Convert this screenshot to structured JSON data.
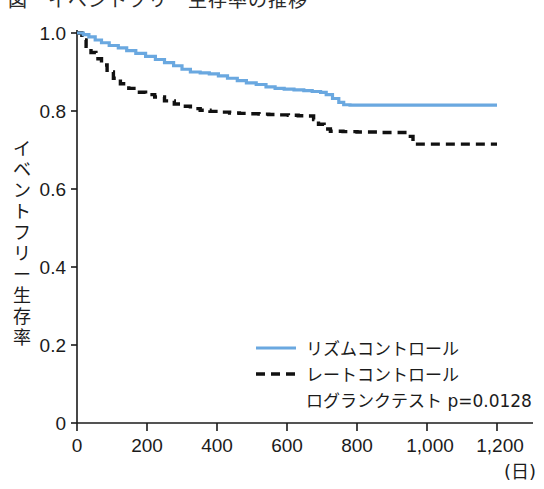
{
  "figure": {
    "top_cut_caption": "図　イベントフリー生存率の推移",
    "background": "#ffffff"
  },
  "chart_data": {
    "type": "line",
    "title": "",
    "subtitle": "",
    "xlabel": "(日)",
    "ylabel": "イベントフリー生存率",
    "xlim": [
      0,
      1290
    ],
    "ylim": [
      0,
      1.0
    ],
    "grid": false,
    "legend_position": "bottom-right",
    "x_ticks": [
      0,
      200,
      400,
      600,
      800,
      1000,
      1200
    ],
    "x_tick_labels": [
      "0",
      "200",
      "400",
      "600",
      "800",
      "1,000",
      "1,200"
    ],
    "y_ticks": [
      0,
      0.2,
      0.4,
      0.6,
      0.8,
      1.0
    ],
    "y_tick_labels": [
      "0",
      "0.2",
      "0.4",
      "0.6",
      "0.8",
      "1.0"
    ],
    "annotations": [
      {
        "name": "logrank-test",
        "text": "ログランクテスト p=0.0128",
        "p_value": "0.0128"
      }
    ],
    "series": [
      {
        "name": "リズムコントロール",
        "style": "solid",
        "color": "#6aa8e0",
        "step": "post",
        "x": [
          0,
          18,
          34,
          52,
          70,
          92,
          118,
          142,
          168,
          196,
          224,
          250,
          276,
          300,
          324,
          352,
          378,
          404,
          430,
          458,
          484,
          512,
          540,
          566,
          592,
          620,
          648,
          672,
          696,
          712,
          730,
          748,
          762,
          780,
          1200
        ],
        "y": [
          1.0,
          0.996,
          0.99,
          0.982,
          0.975,
          0.968,
          0.962,
          0.955,
          0.948,
          0.94,
          0.932,
          0.924,
          0.916,
          0.907,
          0.9,
          0.898,
          0.895,
          0.89,
          0.884,
          0.878,
          0.872,
          0.868,
          0.862,
          0.858,
          0.856,
          0.854,
          0.852,
          0.85,
          0.848,
          0.842,
          0.832,
          0.822,
          0.816,
          0.815,
          0.815
        ]
      },
      {
        "name": "レートコントロール",
        "style": "dashed",
        "color": "#111111",
        "step": "post",
        "x": [
          0,
          14,
          26,
          40,
          54,
          70,
          86,
          104,
          124,
          148,
          172,
          196,
          222,
          250,
          278,
          300,
          324,
          352,
          380,
          408,
          436,
          464,
          492,
          520,
          548,
          576,
          604,
          632,
          660,
          676,
          690,
          706,
          724,
          760,
          800,
          860,
          920,
          944,
          960,
          1200
        ],
        "y": [
          1.0,
          0.982,
          0.966,
          0.95,
          0.934,
          0.918,
          0.9,
          0.884,
          0.87,
          0.858,
          0.848,
          0.842,
          0.836,
          0.826,
          0.818,
          0.812,
          0.806,
          0.802,
          0.799,
          0.797,
          0.795,
          0.794,
          0.793,
          0.792,
          0.791,
          0.79,
          0.789,
          0.788,
          0.787,
          0.778,
          0.766,
          0.754,
          0.748,
          0.747,
          0.746,
          0.745,
          0.745,
          0.735,
          0.715,
          0.715
        ]
      }
    ]
  },
  "legend": {
    "items": [
      {
        "label": "リズムコントロール",
        "style": "solid",
        "color": "#6aa8e0"
      },
      {
        "label": "レートコントロール",
        "style": "dashed",
        "color": "#111111"
      }
    ],
    "note": "ログランクテスト p=0.0128"
  }
}
